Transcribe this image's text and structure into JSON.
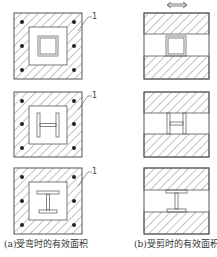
{
  "diagram": {
    "columns": [
      {
        "id": "a",
        "caption": "(a)受弯时的有效面积",
        "panels": [
          {
            "section": "box",
            "label": "1"
          },
          {
            "section": "H",
            "label": "1"
          },
          {
            "section": "I",
            "label": "1"
          }
        ]
      },
      {
        "id": "b",
        "caption": "(b)受剪时的有效面积",
        "direction_indicator": "double-arrow-horizontal",
        "panels": [
          {
            "section": "box"
          },
          {
            "section": "H"
          },
          {
            "section": "I"
          }
        ]
      }
    ],
    "colors": {
      "stroke": "#555555",
      "hatch": "#666666",
      "rebar": "#222222",
      "background": "#ffffff"
    }
  }
}
